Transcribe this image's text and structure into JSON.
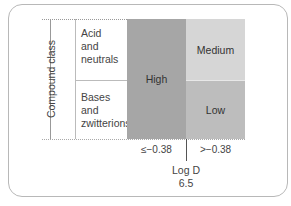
{
  "diagram": {
    "y_axis_label": "Compound class",
    "rows": [
      {
        "label_lines": [
          "Acid",
          "and",
          "neutrals"
        ]
      },
      {
        "label_lines": [
          "Bases",
          "and",
          "zwitterions"
        ]
      }
    ],
    "cells": {
      "high": "High",
      "medium": "Medium",
      "low": "Low"
    },
    "x_ticks": [
      "≤−0.38",
      ">−0.38"
    ],
    "x_axis_label": "Log D",
    "x_axis_sublabel": "6.5",
    "colors": {
      "high": "#a6a6a6",
      "medium": "#d6d6d6",
      "low": "#bdbdbd"
    }
  }
}
